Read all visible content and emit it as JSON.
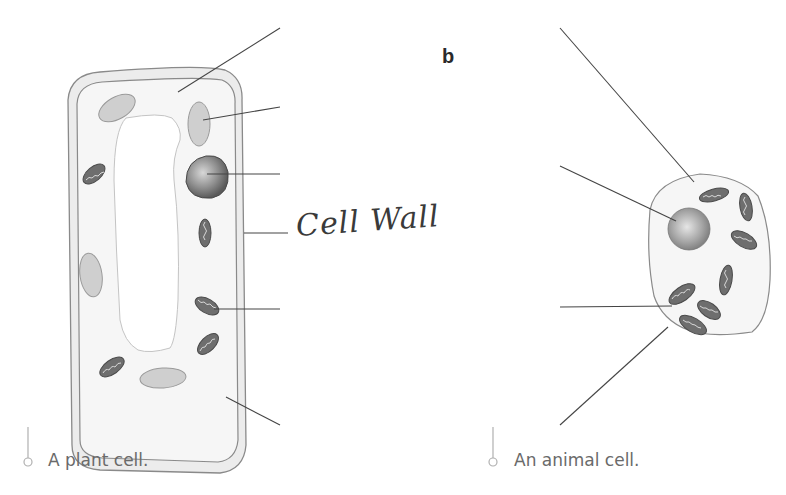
{
  "panel_b": {
    "label": "b"
  },
  "plant_cell": {
    "caption": "A plant cell.",
    "handwritten_label": "Cell Wall",
    "blank_label_lines": 6
  },
  "animal_cell": {
    "caption": "An animal cell.",
    "blank_label_lines": 4
  },
  "colors": {
    "cell_wall_fill": "#ececec",
    "cytoplasm_fill": "#f6f6f6",
    "outline": "#8a8a8a",
    "chloroplast_fill": "#cfcfcf",
    "nucleus_fill": "#8c8c8c",
    "mitochondrion_fill": "#6e6e6e",
    "leader_line": "#444444",
    "caption_text": "#6a6a6a"
  }
}
